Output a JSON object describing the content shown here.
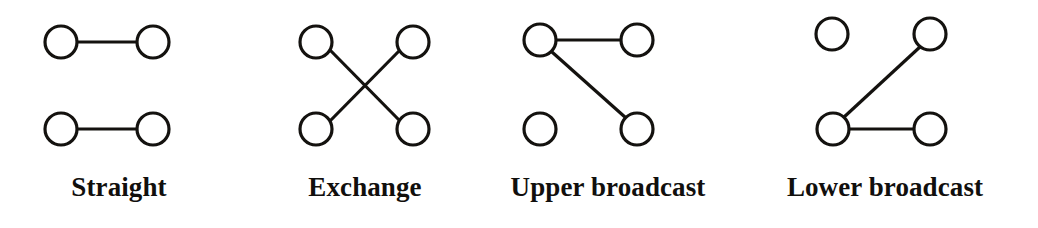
{
  "figure": {
    "background_color": "#ffffff",
    "ink_color": "#14120f",
    "node_fill": "#ffffff",
    "stroke_width": 3.2,
    "node_radius": 16,
    "panel_count": 4
  },
  "panels": [
    {
      "id": "straight",
      "label": "Straight",
      "nodes": [
        {
          "name": "upper-left",
          "cx": 61,
          "cy": 42
        },
        {
          "name": "upper-right",
          "cx": 153,
          "cy": 42
        },
        {
          "name": "lower-left",
          "cx": 61,
          "cy": 129
        },
        {
          "name": "lower-right",
          "cx": 153,
          "cy": 129
        }
      ],
      "links": [
        {
          "name": "upper-left-to-upper-right",
          "x1": 77,
          "y1": 42,
          "x2": 137,
          "y2": 42
        },
        {
          "name": "lower-left-to-lower-right",
          "x1": 77,
          "y1": 129,
          "x2": 137,
          "y2": 129
        }
      ]
    },
    {
      "id": "exchange",
      "label": "Exchange",
      "nodes": [
        {
          "name": "upper-left",
          "cx": 316,
          "cy": 42
        },
        {
          "name": "upper-right",
          "cx": 413,
          "cy": 42
        },
        {
          "name": "lower-left",
          "cx": 316,
          "cy": 129
        },
        {
          "name": "lower-right",
          "cx": 413,
          "cy": 129
        }
      ],
      "links": [
        {
          "name": "upper-left-to-lower-right",
          "x1": 330,
          "y1": 50,
          "x2": 400,
          "y2": 121
        },
        {
          "name": "lower-left-to-upper-right",
          "x1": 330,
          "y1": 121,
          "x2": 400,
          "y2": 50
        }
      ]
    },
    {
      "id": "upper-broadcast",
      "label": "Upper broadcast",
      "nodes": [
        {
          "name": "upper-left",
          "cx": 540,
          "cy": 40
        },
        {
          "name": "upper-right",
          "cx": 637,
          "cy": 40
        },
        {
          "name": "lower-left",
          "cx": 540,
          "cy": 129
        },
        {
          "name": "lower-right",
          "cx": 637,
          "cy": 129
        }
      ],
      "links": [
        {
          "name": "upper-left-to-upper-right",
          "x1": 556,
          "y1": 40,
          "x2": 621,
          "y2": 40
        },
        {
          "name": "upper-left-to-lower-right",
          "x1": 552,
          "y1": 52,
          "x2": 626,
          "y2": 118
        }
      ]
    },
    {
      "id": "lower-broadcast",
      "label": "Lower broadcast",
      "nodes": [
        {
          "name": "upper-left",
          "cx": 832,
          "cy": 34
        },
        {
          "name": "upper-right",
          "cx": 930,
          "cy": 34
        },
        {
          "name": "lower-left",
          "cx": 833,
          "cy": 129
        },
        {
          "name": "lower-right",
          "cx": 930,
          "cy": 129
        }
      ],
      "links": [
        {
          "name": "lower-left-to-upper-right",
          "x1": 843,
          "y1": 118,
          "x2": 921,
          "y2": 46
        },
        {
          "name": "lower-left-to-lower-right",
          "x1": 849,
          "y1": 129,
          "x2": 914,
          "y2": 129
        }
      ]
    }
  ]
}
